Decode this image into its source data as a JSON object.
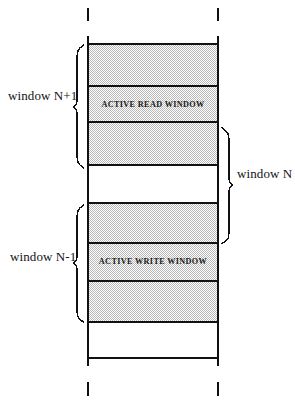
{
  "diagram": {
    "colors": {
      "line": "#111111",
      "fill_shaded": "#d9d9d9",
      "fill_empty": "#ffffff",
      "text": "#141414"
    },
    "geometry": {
      "rail_left_x": 88,
      "rail_right_x": 218,
      "rail_top_y": 36,
      "rail_bottom_y": 366,
      "band_edges_y": [
        44,
        86,
        122,
        165,
        203,
        243,
        281,
        322,
        358
      ]
    },
    "bands": [
      {
        "id": "band-1",
        "label": "",
        "shaded": true,
        "top": 44,
        "bottom": 86
      },
      {
        "id": "band-2",
        "label": "ACTIVE READ WINDOW",
        "shaded": true,
        "top": 86,
        "bottom": 122
      },
      {
        "id": "band-3",
        "label": "",
        "shaded": true,
        "top": 122,
        "bottom": 165
      },
      {
        "id": "band-4",
        "label": "",
        "shaded": false,
        "top": 165,
        "bottom": 203
      },
      {
        "id": "band-5",
        "label": "",
        "shaded": true,
        "top": 203,
        "bottom": 243
      },
      {
        "id": "band-6",
        "label": "ACTIVE WRITE WINDOW",
        "shaded": true,
        "top": 243,
        "bottom": 281
      },
      {
        "id": "band-7",
        "label": "",
        "shaded": true,
        "top": 281,
        "bottom": 322
      },
      {
        "id": "band-8",
        "label": "",
        "shaded": false,
        "top": 322,
        "bottom": 358
      }
    ],
    "band_labels": {
      "active_read_window": "ACTIVE READ WINDOW",
      "active_write_window": "ACTIVE WRITE WINDOW"
    },
    "braces": [
      {
        "id": "brace-window-n-plus-1",
        "side": "left",
        "label": "window N+1",
        "top": 45,
        "bottom": 168
      },
      {
        "id": "brace-window-n-minus-1",
        "side": "left",
        "label": "window N-1",
        "top": 205,
        "bottom": 322
      },
      {
        "id": "brace-window-n",
        "side": "right",
        "label": "window N",
        "top": 128,
        "bottom": 243
      }
    ],
    "labels": {
      "window_n_plus_1": "window N+1",
      "window_n_minus_1": "window N-1",
      "window_n": "window N"
    },
    "ticks": {
      "top": [
        {
          "id": "tick-top-left",
          "x": 88,
          "y1": 8,
          "y2": 21
        },
        {
          "id": "tick-top-right",
          "x": 218,
          "y1": 8,
          "y2": 21
        }
      ],
      "bottom": [
        {
          "id": "tick-bottom-left",
          "x": 88,
          "y1": 382,
          "y2": 396
        },
        {
          "id": "tick-bottom-right",
          "x": 218,
          "y1": 382,
          "y2": 396
        }
      ]
    }
  }
}
